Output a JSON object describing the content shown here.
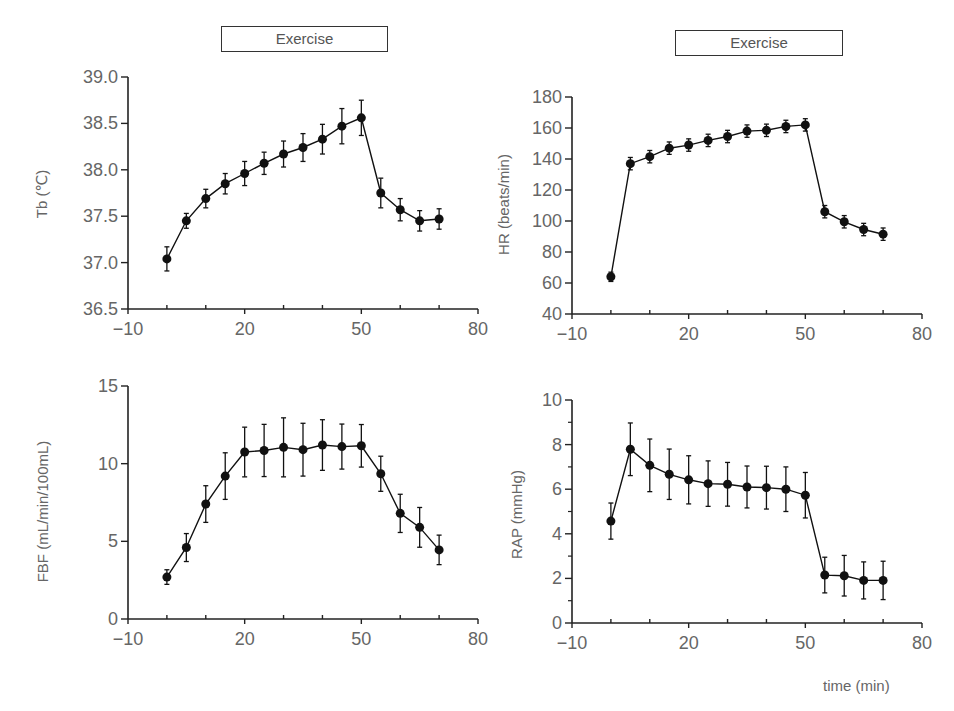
{
  "figure": {
    "exercise_label": "Exercise",
    "time_label": "time (min)",
    "panels": [
      {
        "id": "tb",
        "ylabel": "Tb (℃)"
      },
      {
        "id": "hr",
        "ylabel": "HR (beats/min)"
      },
      {
        "id": "fbf",
        "ylabel": "FBF (mL/min/100mL)"
      },
      {
        "id": "rap",
        "ylabel": "RAP (mmHg)"
      }
    ]
  },
  "chart_data": [
    {
      "type": "line",
      "title": "",
      "annotation": "Exercise",
      "xlabel": "",
      "ylabel": "Tb (℃)",
      "xlim": [
        -10,
        80
      ],
      "ylim": [
        36.5,
        39.0
      ],
      "xticks": [
        -10,
        0,
        10,
        20,
        30,
        40,
        50,
        60,
        70,
        80
      ],
      "xtick_labels": {
        "-10": "−10",
        "20": "20",
        "50": "50",
        "80": "80"
      },
      "yticks": [
        36.5,
        37.0,
        37.5,
        38.0,
        38.5,
        39.0
      ],
      "ytick_labels": [
        "36.5",
        "37.0",
        "37.5",
        "38.0",
        "38.5",
        "39.0"
      ],
      "yminor": [],
      "grid": false,
      "x": [
        0,
        5,
        10,
        15,
        20,
        25,
        30,
        35,
        40,
        45,
        50,
        55,
        60,
        65,
        70
      ],
      "series": [
        {
          "name": "Tb",
          "values": [
            37.04,
            37.45,
            37.69,
            37.85,
            37.96,
            38.07,
            38.17,
            38.24,
            38.33,
            38.47,
            38.56,
            37.75,
            37.57,
            37.45,
            37.47
          ],
          "error": [
            0.13,
            0.08,
            0.1,
            0.11,
            0.13,
            0.12,
            0.14,
            0.15,
            0.16,
            0.19,
            0.19,
            0.16,
            0.12,
            0.11,
            0.11
          ]
        }
      ]
    },
    {
      "type": "line",
      "title": "",
      "annotation": "Exercise",
      "xlabel": "",
      "ylabel": "HR (beats/min)",
      "xlim": [
        -10,
        80
      ],
      "ylim": [
        40,
        180
      ],
      "xticks": [
        -10,
        0,
        10,
        20,
        30,
        40,
        50,
        60,
        70,
        80
      ],
      "xtick_labels": {
        "-10": "−10",
        "20": "20",
        "50": "50",
        "80": "80"
      },
      "yticks": [
        40,
        60,
        80,
        100,
        120,
        140,
        160,
        180
      ],
      "ytick_labels": [
        "40",
        "60",
        "80",
        "100",
        "120",
        "140",
        "160",
        "180"
      ],
      "yminor": [],
      "grid": false,
      "x": [
        0,
        5,
        10,
        15,
        20,
        25,
        30,
        35,
        40,
        45,
        50,
        55,
        60,
        65,
        70
      ],
      "series": [
        {
          "name": "HR",
          "values": [
            64,
            137,
            141.5,
            147,
            149,
            152,
            154.5,
            158,
            158.5,
            161,
            162,
            106,
            99.5,
            94.5,
            91.5
          ],
          "error": [
            3,
            4,
            4,
            4,
            4,
            4,
            4,
            4,
            4,
            4,
            4,
            4,
            4,
            4,
            4
          ]
        }
      ]
    },
    {
      "type": "line",
      "title": "",
      "annotation": "",
      "xlabel": "",
      "ylabel": "FBF (mL/min/100mL)",
      "xlim": [
        -10,
        80
      ],
      "ylim": [
        0,
        15
      ],
      "xticks": [
        -10,
        0,
        10,
        20,
        30,
        40,
        50,
        60,
        70,
        80
      ],
      "xtick_labels": {
        "-10": "−10",
        "20": "20",
        "50": "50",
        "80": "80"
      },
      "yticks": [
        0,
        5,
        10,
        15
      ],
      "ytick_labels": [
        "0",
        "5",
        "10",
        "15"
      ],
      "yminor": [],
      "grid": false,
      "x": [
        0,
        5,
        10,
        15,
        20,
        25,
        30,
        35,
        40,
        45,
        50,
        55,
        60,
        65,
        70
      ],
      "series": [
        {
          "name": "FBF",
          "values": [
            2.7,
            4.6,
            7.4,
            9.2,
            10.75,
            10.85,
            11.05,
            10.9,
            11.2,
            11.1,
            11.15,
            9.35,
            6.8,
            5.9,
            4.45
          ],
          "error": [
            0.47,
            0.9,
            1.18,
            1.5,
            1.6,
            1.68,
            1.9,
            1.7,
            1.63,
            1.45,
            1.37,
            1.13,
            1.23,
            1.28,
            0.95
          ]
        }
      ]
    },
    {
      "type": "line",
      "title": "",
      "annotation": "",
      "xlabel": "time (min)",
      "ylabel": "RAP (mmHg)",
      "xlim": [
        -10,
        80
      ],
      "ylim": [
        0,
        10
      ],
      "xticks": [
        -10,
        0,
        10,
        20,
        30,
        40,
        50,
        60,
        70,
        80
      ],
      "xtick_labels": {
        "-10": "−10",
        "20": "20",
        "50": "50",
        "80": "80"
      },
      "yticks": [
        0,
        2,
        4,
        6,
        8,
        10
      ],
      "ytick_labels": [
        "0",
        "2",
        "4",
        "6",
        "8",
        "10"
      ],
      "yminor": [
        1,
        3,
        5,
        7,
        9
      ],
      "grid": false,
      "x": [
        0,
        5,
        10,
        15,
        20,
        25,
        30,
        35,
        40,
        45,
        50,
        55,
        60,
        65,
        70
      ],
      "series": [
        {
          "name": "RAP",
          "values": [
            4.57,
            7.79,
            7.07,
            6.67,
            6.42,
            6.25,
            6.22,
            6.1,
            6.07,
            6.0,
            5.73,
            2.15,
            2.12,
            1.91,
            1.91
          ],
          "error": [
            0.81,
            1.18,
            1.18,
            1.13,
            1.08,
            1.02,
            0.98,
            0.94,
            0.96,
            1.0,
            1.02,
            0.8,
            0.91,
            0.83,
            0.86
          ]
        }
      ]
    }
  ]
}
